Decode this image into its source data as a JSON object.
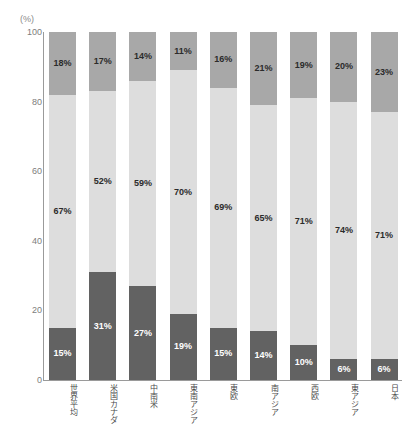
{
  "axis_unit_label": "(%)",
  "chart_data": {
    "type": "bar",
    "stacked": true,
    "title": "",
    "subtitle": "",
    "xlabel": "",
    "ylabel": "",
    "unit": "(%)",
    "ylim": [
      0,
      100
    ],
    "ytick_labels": [
      "100",
      "80",
      "60",
      "40",
      "20",
      "0"
    ],
    "ytick_values": [
      100,
      80,
      60,
      40,
      20,
      0
    ],
    "grid": false,
    "legend": "none",
    "categories": [
      "世界平均",
      "米国カナダ",
      "中南米",
      "東南アジア",
      "東欧",
      "南アジア",
      "西欧",
      "東アジア",
      "日本"
    ],
    "series": [
      {
        "name": "top-segment",
        "color": "#a8a8a8",
        "values": [
          18,
          17,
          14,
          11,
          16,
          21,
          19,
          20,
          23
        ],
        "labels": [
          "18%",
          "17%",
          "14%",
          "11%",
          "16%",
          "21%",
          "19%",
          "20%",
          "23%"
        ]
      },
      {
        "name": "middle-segment",
        "color": "#dddddd",
        "values": [
          67,
          52,
          59,
          70,
          69,
          65,
          71,
          74,
          71
        ],
        "labels": [
          "67%",
          "52%",
          "59%",
          "70%",
          "69%",
          "65%",
          "71%",
          "74%",
          "71%"
        ]
      },
      {
        "name": "bottom-segment",
        "color": "#626262",
        "values": [
          15,
          31,
          27,
          19,
          15,
          14,
          10,
          6,
          6
        ],
        "labels": [
          "15%",
          "31%",
          "27%",
          "19%",
          "15%",
          "14%",
          "10%",
          "6%",
          "6%"
        ]
      }
    ]
  }
}
